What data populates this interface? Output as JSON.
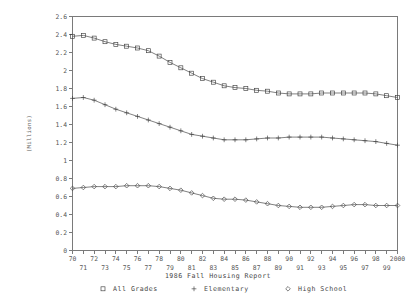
{
  "chart_data": {
    "type": "line",
    "title": "",
    "xlabel": "1986 Fall Housing Report",
    "ylabel": "(Millions)",
    "grid": false,
    "legend_position": "bottom",
    "xlim": [
      1970,
      2000
    ],
    "ylim": [
      0,
      2.6
    ],
    "ytick_values": [
      0,
      0.2,
      0.4,
      0.6,
      0.8,
      1,
      1.2,
      1.4,
      1.6,
      1.8,
      2,
      2.2,
      2.4,
      2.6
    ],
    "ytick_labels": [
      "0",
      "0.2",
      "0.4",
      "0.6",
      "0.8",
      "1",
      "1.2",
      "1.4",
      "1.6",
      "1.8",
      "2",
      "2.2",
      "2.4",
      "2.6"
    ],
    "x": [
      1970,
      1971,
      1972,
      1973,
      1974,
      1975,
      1976,
      1977,
      1978,
      1979,
      1980,
      1981,
      1982,
      1983,
      1984,
      1985,
      1986,
      1987,
      1988,
      1989,
      1990,
      1991,
      1992,
      1993,
      1994,
      1995,
      1996,
      1997,
      1998,
      1999,
      2000
    ],
    "xtick_labels": [
      "70",
      "71",
      "72",
      "73",
      "74",
      "75",
      "76",
      "77",
      "78",
      "79",
      "80",
      "81",
      "82",
      "83",
      "84",
      "85",
      "86",
      "87",
      "88",
      "89",
      "90",
      "91",
      "92",
      "93",
      "94",
      "95",
      "96",
      "97",
      "98",
      "99",
      "2000"
    ],
    "series": [
      {
        "name": "All Grades",
        "marker": "square",
        "values": [
          2.38,
          2.39,
          2.36,
          2.32,
          2.29,
          2.27,
          2.25,
          2.22,
          2.16,
          2.09,
          2.03,
          1.97,
          1.91,
          1.87,
          1.83,
          1.81,
          1.8,
          1.78,
          1.77,
          1.75,
          1.74,
          1.74,
          1.74,
          1.75,
          1.75,
          1.75,
          1.75,
          1.75,
          1.74,
          1.72,
          1.7
        ]
      },
      {
        "name": "Elementary",
        "marker": "plus",
        "values": [
          1.69,
          1.7,
          1.67,
          1.62,
          1.57,
          1.53,
          1.49,
          1.45,
          1.41,
          1.37,
          1.33,
          1.29,
          1.27,
          1.25,
          1.23,
          1.23,
          1.23,
          1.24,
          1.25,
          1.25,
          1.26,
          1.26,
          1.26,
          1.26,
          1.25,
          1.24,
          1.23,
          1.22,
          1.21,
          1.19,
          1.17
        ]
      },
      {
        "name": "High School",
        "marker": "diamond",
        "values": [
          0.69,
          0.7,
          0.71,
          0.71,
          0.71,
          0.72,
          0.72,
          0.72,
          0.71,
          0.69,
          0.67,
          0.64,
          0.61,
          0.58,
          0.57,
          0.57,
          0.56,
          0.54,
          0.52,
          0.5,
          0.49,
          0.48,
          0.48,
          0.48,
          0.49,
          0.5,
          0.51,
          0.51,
          0.5,
          0.5,
          0.5
        ]
      }
    ],
    "legend": [
      {
        "label": "All Grades",
        "marker": "square"
      },
      {
        "label": "Elementary",
        "marker": "plus"
      },
      {
        "label": "High School",
        "marker": "diamond"
      }
    ]
  }
}
